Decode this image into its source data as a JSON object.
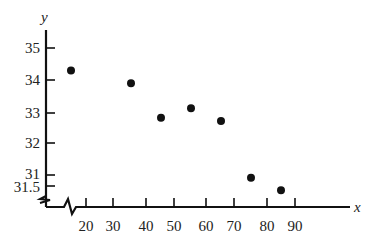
{
  "chart_data": {
    "type": "scatter",
    "title": "",
    "xlabel": "x",
    "ylabel": "y",
    "x_ticks": [
      "20",
      "30",
      "40",
      "50",
      "60",
      "70",
      "80",
      "90"
    ],
    "y_ticks": [
      "35",
      "34",
      "33",
      "32",
      "31",
      "31.5"
    ],
    "axis_break": true,
    "grid": false,
    "points": [
      {
        "x": 15,
        "y": 34.3
      },
      {
        "x": 35,
        "y": 33.9
      },
      {
        "x": 45,
        "y": 32.8
      },
      {
        "x": 55,
        "y": 33.1
      },
      {
        "x": 65,
        "y": 32.7
      },
      {
        "x": 75,
        "y": 30.9
      },
      {
        "x": 85,
        "y": 30.5
      }
    ]
  },
  "labels": {
    "x_axis": "x",
    "y_axis": "y",
    "xt": [
      "20",
      "30",
      "40",
      "50",
      "60",
      "70",
      "80",
      "90"
    ],
    "yt": [
      "35",
      "34",
      "33",
      "32",
      "31",
      "31.5"
    ]
  }
}
